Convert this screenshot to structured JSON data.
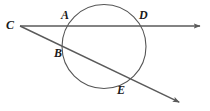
{
  "figure": {
    "type": "geometry-diagram",
    "width": 210,
    "height": 111,
    "background_color": "#ffffff",
    "stroke_color": "#4d4d4d",
    "label_color": "#1a1a1a"
  },
  "circle": {
    "name": "circle",
    "center_x": 104,
    "center_y": 46.5,
    "radius": 42,
    "stroke_color": "#555555",
    "stroke_width": 1.1,
    "fill": "none"
  },
  "points": [
    {
      "id": "C",
      "label": "C",
      "x": 20,
      "y": 26,
      "label_x": 6,
      "label_y": 19,
      "role": "external-vertex"
    },
    {
      "id": "A",
      "label": "A",
      "x": 68,
      "y": 26,
      "label_x": 61,
      "label_y": 9,
      "role": "near-intersection-upper-secant"
    },
    {
      "id": "D",
      "label": "D",
      "x": 140,
      "y": 26,
      "label_x": 139,
      "label_y": 9,
      "role": "far-intersection-upper-secant"
    },
    {
      "id": "B",
      "label": "B",
      "x": 68,
      "y": 48,
      "label_x": 54,
      "label_y": 47,
      "role": "near-intersection-lower-secant"
    },
    {
      "id": "E",
      "label": "E",
      "x": 124,
      "y": 80,
      "label_x": 117,
      "label_y": 84,
      "role": "far-intersection-lower-secant"
    }
  ],
  "rays": [
    {
      "id": "ray-CAD",
      "name": "upper-secant-ray",
      "from": "C",
      "through": [
        "A",
        "D"
      ],
      "x1": 20,
      "y1": 26,
      "x2": 202,
      "y2": 26,
      "arrow_at_end": true,
      "stroke_color": "#5a5a5a",
      "stroke_width": 1.4
    },
    {
      "id": "ray-CBE",
      "name": "lower-secant-ray",
      "from": "C",
      "through": [
        "B",
        "E"
      ],
      "x1": 20,
      "y1": 26,
      "x2": 181,
      "y2": 103,
      "arrow_at_end": true,
      "stroke_color": "#5a5a5a",
      "stroke_width": 1.4
    }
  ],
  "arrowheads": [
    {
      "id": "arrow-upper",
      "name": "right-arrowhead",
      "x": 202,
      "y": 26,
      "angle": 0
    },
    {
      "id": "arrow-lower",
      "name": "lower-right-arrowhead",
      "x": 181,
      "y": 103,
      "angle": 25.6
    }
  ]
}
